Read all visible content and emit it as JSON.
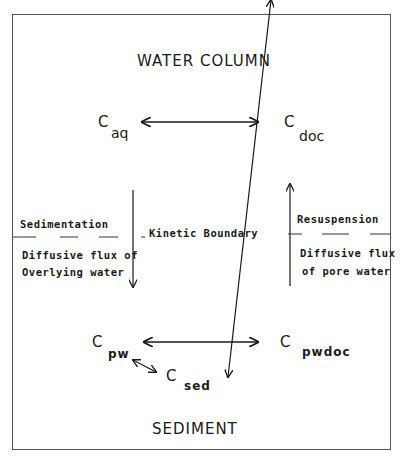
{
  "diagram": {
    "water_column": {
      "title": "WATER COLUMN",
      "c_aq": {
        "symbol": "C",
        "subscript": "aq"
      },
      "c_doc": {
        "symbol": "C",
        "subscript": "doc"
      }
    },
    "boundary": {
      "left_upper": "Sedimentation",
      "left_lower_1": "Diffusive flux of",
      "left_lower_2": "Overlying water",
      "center": "Kinetic Boundary",
      "right_upper": "Resuspension",
      "right_lower_1": "Diffusive flux",
      "right_lower_2": "of pore water"
    },
    "sediment": {
      "title": "SEDIMENT",
      "c_pw": {
        "symbol": "C",
        "subscript": "pw"
      },
      "c_pwdoc": {
        "symbol": "C",
        "subscript": "pwdoc"
      },
      "c_sed": {
        "symbol": "C",
        "subscript": "sed"
      }
    },
    "colors": {
      "line": "#1a1a1a",
      "frame": "#555555",
      "background": "#ffffff"
    }
  }
}
